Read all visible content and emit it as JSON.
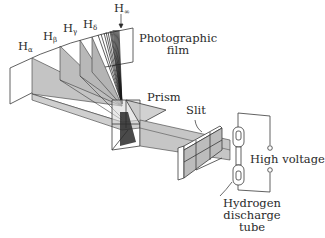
{
  "diagram": {
    "type": "apparatus-illustration",
    "labels": {
      "h_alpha": "H",
      "h_alpha_sub": "α",
      "h_beta": "H",
      "h_beta_sub": "β",
      "h_gamma": "H",
      "h_gamma_sub": "γ",
      "h_delta": "H",
      "h_delta_sub": "δ",
      "h_infinity": "H",
      "h_infinity_sub": "∞",
      "photographic_film_line1": "Photographic",
      "photographic_film_line2": "film",
      "prism": "Prism",
      "slit": "Slit",
      "high_voltage": "High voltage",
      "tube_line1": "Hydrogen",
      "tube_line2": "discharge",
      "tube_line3": "tube"
    },
    "components": [
      "photographic film",
      "prism",
      "slit",
      "hydrogen discharge tube",
      "high voltage source"
    ],
    "spectral_lines": [
      "Hα",
      "Hβ",
      "Hγ",
      "Hδ",
      "H∞"
    ],
    "colors": {
      "beam_fill": "#c8c8c8",
      "beam_fill_dark": "#a8a8a8",
      "line": "#3a3a3a",
      "background": "#ffffff"
    }
  }
}
